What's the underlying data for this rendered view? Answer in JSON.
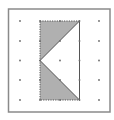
{
  "diagram": {
    "type": "dot-grid-geometry",
    "frame": {
      "x": 8.5,
      "y": 9,
      "width": 101.5,
      "height": 103,
      "stroke": "#8a8a8a"
    },
    "grid": {
      "cols": 5,
      "rows": 5,
      "xs": [
        20,
        40,
        60,
        79.5,
        99
      ],
      "ys": [
        21,
        41,
        60.5,
        80,
        100
      ],
      "dot_color": "#6a6a6a"
    },
    "shaded_rectangle": {
      "x1": 40,
      "y1": 21,
      "x2": 79.5,
      "y2": 100
    },
    "unshaded_triangle": {
      "points": [
        [
          79.5,
          21
        ],
        [
          40,
          60.5
        ],
        [
          79.5,
          100
        ]
      ]
    },
    "colors": {
      "shade": "#b0b0b0",
      "outline": "#555555",
      "background": "#ffffff"
    }
  }
}
